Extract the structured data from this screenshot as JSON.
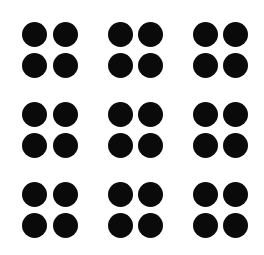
{
  "image": {
    "width": 264,
    "height": 255,
    "background": "#ffffff",
    "dot_color": "#0a0a0a",
    "dot_diameter": 25
  },
  "grid": {
    "group_rows": 3,
    "group_cols": 3,
    "dots_per_group": "2x2",
    "total_dots": 36
  },
  "groups": [
    {
      "id": "r1c1",
      "row": 1,
      "col": 1,
      "dots": [
        [
          34,
          34
        ],
        [
          65,
          34
        ],
        [
          34,
          65
        ],
        [
          65,
          65
        ]
      ]
    },
    {
      "id": "r1c2",
      "row": 1,
      "col": 2,
      "dots": [
        [
          120,
          34
        ],
        [
          150,
          34
        ],
        [
          120,
          65
        ],
        [
          150,
          65
        ]
      ]
    },
    {
      "id": "r1c3",
      "row": 1,
      "col": 3,
      "dots": [
        [
          205,
          34
        ],
        [
          235,
          34
        ],
        [
          205,
          65
        ],
        [
          235,
          65
        ]
      ]
    },
    {
      "id": "r2c1",
      "row": 2,
      "col": 1,
      "dots": [
        [
          34,
          114
        ],
        [
          65,
          114
        ],
        [
          34,
          145
        ],
        [
          65,
          145
        ]
      ]
    },
    {
      "id": "r2c2",
      "row": 2,
      "col": 2,
      "dots": [
        [
          120,
          114
        ],
        [
          150,
          114
        ],
        [
          120,
          145
        ],
        [
          150,
          145
        ]
      ]
    },
    {
      "id": "r2c3",
      "row": 2,
      "col": 3,
      "dots": [
        [
          205,
          114
        ],
        [
          235,
          114
        ],
        [
          205,
          145
        ],
        [
          235,
          145
        ]
      ]
    },
    {
      "id": "r3c1",
      "row": 3,
      "col": 1,
      "dots": [
        [
          34,
          194
        ],
        [
          65,
          194
        ],
        [
          34,
          225
        ],
        [
          65,
          225
        ]
      ]
    },
    {
      "id": "r3c2",
      "row": 3,
      "col": 2,
      "dots": [
        [
          120,
          194
        ],
        [
          150,
          194
        ],
        [
          120,
          225
        ],
        [
          150,
          225
        ]
      ]
    },
    {
      "id": "r3c3",
      "row": 3,
      "col": 3,
      "dots": [
        [
          205,
          194
        ],
        [
          235,
          194
        ],
        [
          205,
          225
        ],
        [
          235,
          225
        ]
      ]
    }
  ]
}
